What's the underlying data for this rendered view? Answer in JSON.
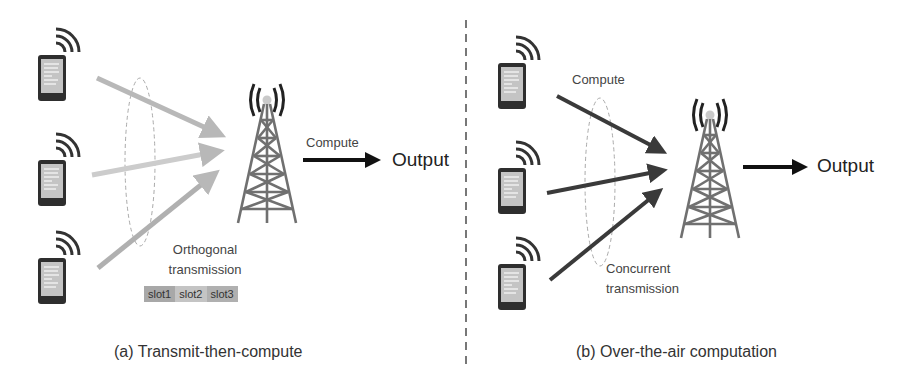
{
  "panels": {
    "a": {
      "caption": "(a) Transmit-then-compute",
      "compute_label": "Compute",
      "output_label": "Output",
      "transmission_label_line1": "Orthogonal",
      "transmission_label_line2": "transmission",
      "slots": [
        "slot1",
        "slot2",
        "slot3"
      ],
      "arrow_color": "#b8b8b8",
      "slot_colors": [
        "#a8a8a8",
        "#c4c4c4",
        "#b0b0b0"
      ]
    },
    "b": {
      "caption": "(b) Over-the-air computation",
      "compute_label": "Compute",
      "output_label": "Output",
      "transmission_label_line1": "Concurrent",
      "transmission_label_line2": "transmission",
      "arrow_color": "#3a3a3a"
    }
  },
  "colors": {
    "tower": "#707070",
    "phone_body": "#2e2e2e",
    "phone_screen": "#bdbdbd",
    "divider": "#777777"
  }
}
